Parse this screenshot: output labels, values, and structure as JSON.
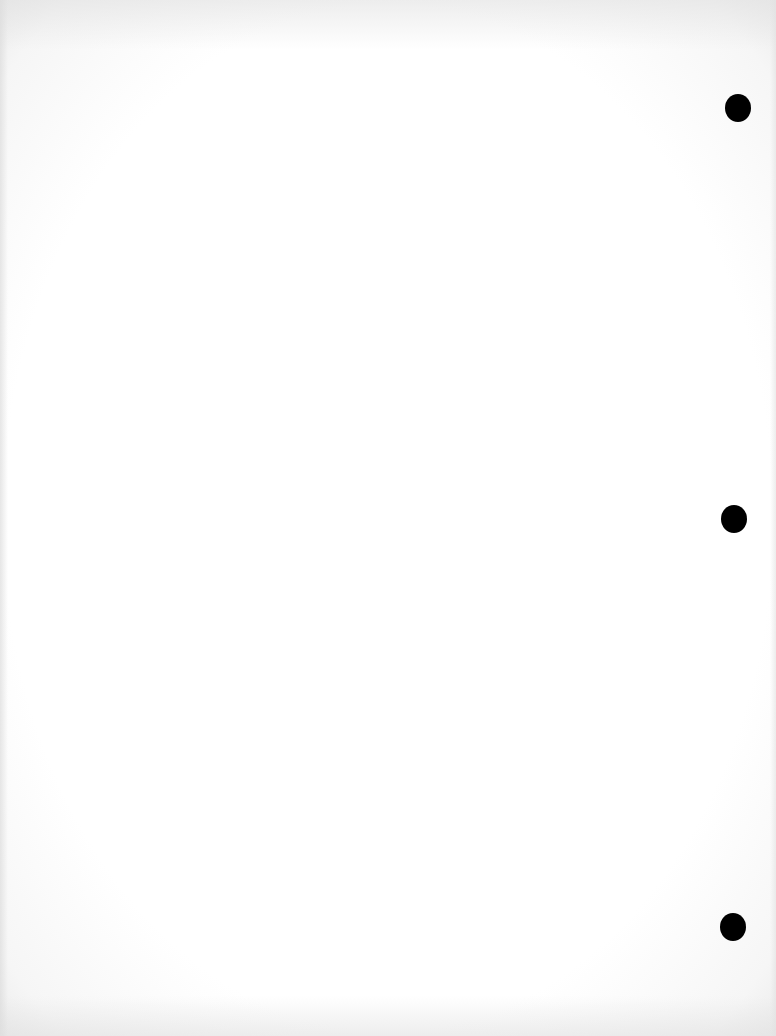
{
  "page": {
    "type": "blank scanned page",
    "background_color": "#ffffff",
    "text_content": ""
  },
  "punch_holes": [
    {
      "label": "top",
      "cx": 738,
      "cy": 108,
      "color": "#000000"
    },
    {
      "label": "middle",
      "cx": 734,
      "cy": 519,
      "color": "#000000"
    },
    {
      "label": "bottom",
      "cx": 733,
      "cy": 927,
      "color": "#000000"
    }
  ]
}
